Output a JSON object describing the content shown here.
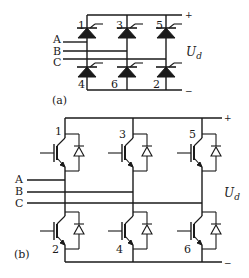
{
  "figure_a": {
    "caption": "(a)",
    "type": "thyristor three-phase bridge",
    "inputs": [
      "A",
      "B",
      "C"
    ],
    "upper_devices": [
      "1",
      "3",
      "5"
    ],
    "lower_devices": [
      "4",
      "6",
      "2"
    ],
    "plus_label": "+",
    "minus_label": "−",
    "output_label": "U",
    "output_subscript": "d"
  },
  "figure_b": {
    "caption": "(b)",
    "type": "IGBT three-phase bridge with antiparallel diodes",
    "inputs": [
      "A",
      "B",
      "C"
    ],
    "upper_devices": [
      "1",
      "3",
      "5"
    ],
    "lower_devices": [
      "2",
      "4",
      "6"
    ],
    "plus_label": "+",
    "minus_label": "−",
    "output_label": "U",
    "output_subscript": "d"
  },
  "colors": {
    "ink": "#1a1a1a",
    "background": "#ffffff"
  }
}
